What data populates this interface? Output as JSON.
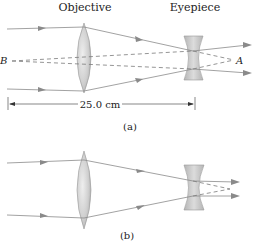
{
  "labels": {
    "objective": "Objective",
    "eyepiece": "Eyepiece",
    "point_b": "B",
    "point_a": "A",
    "distance": "25.0 cm",
    "panel_a": "(a)",
    "panel_b": "(b)"
  },
  "colors": {
    "ray": "#8a8a8a",
    "dashed": "#7a7a7a",
    "lens_fill": "#c4c4c4",
    "lens_edge": "#9a9a9a",
    "eyepiece_fill": "#c8c8c8",
    "text": "#222222"
  }
}
